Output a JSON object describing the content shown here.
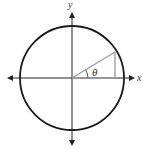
{
  "diagram": {
    "labels": {
      "x_axis": "x",
      "y_axis": "y",
      "angle": "θ"
    },
    "colors": {
      "circle": "#1a1a1a",
      "axes": "#222222",
      "radius": "#9a9a9a",
      "background": "#ffffff"
    },
    "geometry": {
      "center": [
        72,
        78
      ],
      "radius": 52,
      "angle_point": [
        115,
        52
      ]
    }
  }
}
